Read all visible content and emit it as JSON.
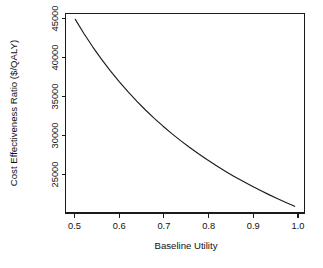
{
  "figure": {
    "name": "cost-effectiveness-ratio-vs-baseline-utility",
    "background_color": "#ffffff",
    "line_color": "#1c1c1c",
    "axis_color": "#1a1a1a",
    "text_color": "#101010"
  },
  "chart_data": {
    "type": "line",
    "title": "",
    "subtitle": "",
    "xlabel": "Baseline Utility",
    "ylabel": "Cost Effectiveness Ratio ($/QALY)",
    "xlim": [
      0.4777,
      1.0223
    ],
    "ylim": [
      21600,
      45500
    ],
    "xticks": [
      0.5,
      0.6,
      0.7,
      0.8,
      0.9,
      1.0
    ],
    "xtick_labels": [
      "0.5",
      "0.6",
      "0.7",
      "0.8",
      "0.9",
      "1.0"
    ],
    "yticks": [
      25000,
      30000,
      35000,
      40000,
      45000
    ],
    "ytick_labels": [
      "25000",
      "30000",
      "35000",
      "40000",
      "45000"
    ],
    "grid": false,
    "legend": null,
    "legend_position": "none",
    "box": true,
    "annotations": [],
    "series": [
      {
        "name": "Cost effectiveness ratio",
        "x": [
          0.5,
          0.52,
          0.54,
          0.56,
          0.58,
          0.6,
          0.62,
          0.64,
          0.66,
          0.68,
          0.7,
          0.72,
          0.74,
          0.76,
          0.78,
          0.8,
          0.82,
          0.84,
          0.86,
          0.88,
          0.9,
          0.92,
          0.94,
          0.96,
          0.98,
          1.0
        ],
        "values": [
          44800,
          43077,
          41481,
          40000,
          38621,
          37333,
          36129,
          35000,
          33939,
          32941,
          32000,
          31111,
          30270,
          29474,
          28718,
          28000,
          27317,
          26667,
          26047,
          25455,
          24889,
          24348,
          23830,
          23333,
          22857,
          22400
        ]
      }
    ]
  },
  "axis": {
    "x_title": "Baseline Utility",
    "y_title": "Cost Effectiveness Ratio ($/QALY)"
  }
}
